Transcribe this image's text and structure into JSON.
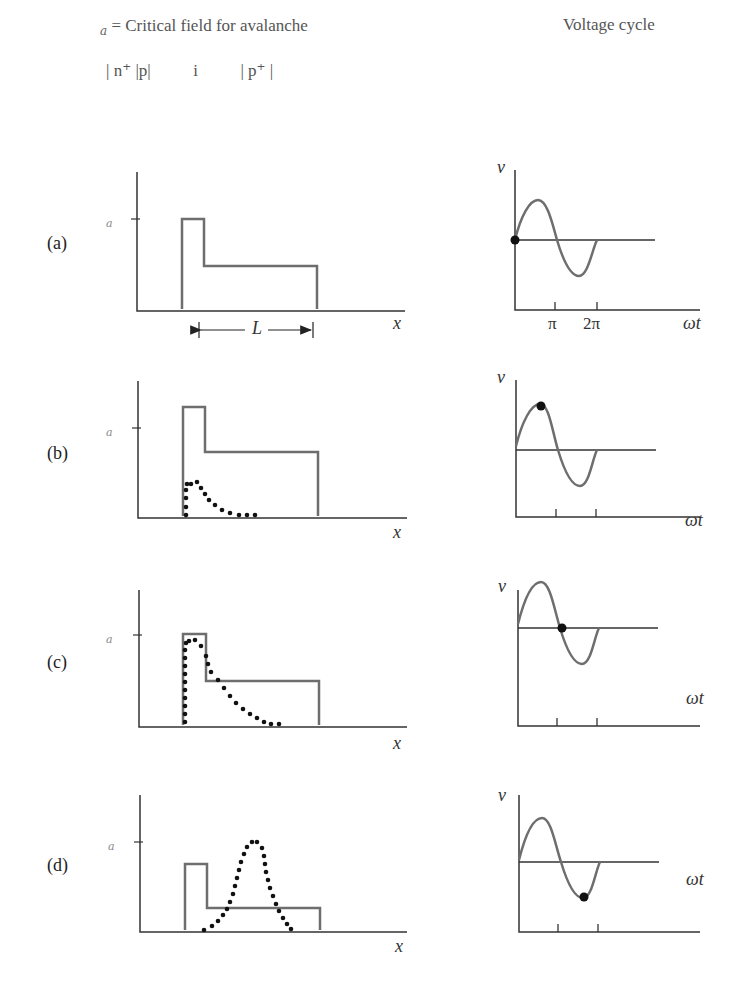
{
  "header": {
    "legend_symbol": "𝒠",
    "legend_subscript": "a",
    "legend_text": " = Critical field for avalanche",
    "regions_label": "| n⁺ |p|          i          | p⁺ |",
    "right_title": "Voltage cycle"
  },
  "field_axis": {
    "y_symbol": "𝒠",
    "ea_symbol": "𝒠",
    "ea_sub": "a",
    "x_label": "x",
    "length_label": "L"
  },
  "voltage_axis": {
    "y_label": "v",
    "x_label": "ωt",
    "tick_pi": "π",
    "tick_2pi": "2π"
  },
  "panels": [
    {
      "id": "a",
      "label": "(a)",
      "dot_phase": "0"
    },
    {
      "id": "b",
      "label": "(b)",
      "dot_phase": "π/2"
    },
    {
      "id": "c",
      "label": "(c)",
      "dot_phase": "π"
    },
    {
      "id": "d",
      "label": "(d)",
      "dot_phase": "3π/2"
    }
  ],
  "colors": {
    "curve": "#6e6e6e",
    "axis": "#333333",
    "dots": "#111111"
  }
}
